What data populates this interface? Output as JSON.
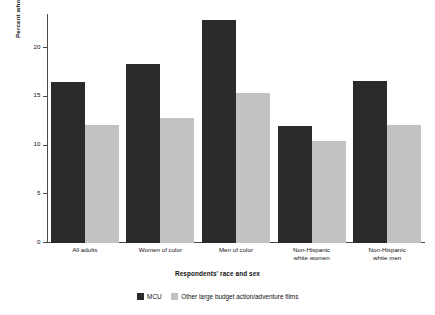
{
  "chart_data": {
    "type": "bar",
    "title": "",
    "subtitle": "",
    "xlabel": "Respondents' race and sex",
    "ylabel": "Percent who saw film",
    "categories": [
      "All adults",
      "Women of color",
      "Men of color",
      "Non-Hispanic\nwhite women",
      "Non-Hispanic\nwhite men"
    ],
    "series": [
      {
        "name": "MCU",
        "color": "#2b2b2b",
        "values": [
          16.5,
          18.4,
          22.9,
          12.0,
          16.6
        ]
      },
      {
        "name": "Other large budget action/adventure films",
        "color": "#c2c2c2",
        "values": [
          12.1,
          12.8,
          15.4,
          10.5,
          12.1
        ]
      }
    ],
    "ylim": [
      0,
      23.5
    ],
    "yticks": [
      0,
      5,
      10,
      15,
      20
    ],
    "ytick_labels": [
      "0",
      "5",
      "10",
      "15",
      "20"
    ],
    "grid": false,
    "legend_position": "bottom"
  },
  "legend": {
    "items": [
      {
        "label": "MCU",
        "color": "#2b2b2b"
      },
      {
        "label": "Other large budget action/adventure films",
        "color": "#c2c2c2"
      }
    ]
  }
}
